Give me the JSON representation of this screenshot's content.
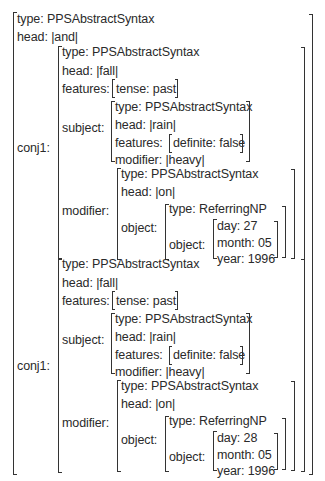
{
  "root": {
    "type_label": "type: PPSAbstractSyntax",
    "head_label": "head: |and|",
    "conj_label_1": "conj1:",
    "conj_label_2": "conj1:"
  },
  "conjuncts": [
    {
      "type_label": "type: PPSAbstractSyntax",
      "head_label": "head: |fall|",
      "features_key": "features:",
      "features_value": "tense: past",
      "subject_key": "subject:",
      "subject": {
        "type_label": "type: PPSAbstractSyntax",
        "head_label": "head: |rain|",
        "features_key": "features:",
        "features_value": "definite: false",
        "modifier_label": "modifier: |heavy|"
      },
      "modifier_key": "modifier:",
      "modifier": {
        "type_label": "type: PPSAbstractSyntax",
        "head_label": "head: |on|",
        "object_key": "object:",
        "object": {
          "type_label": "type: ReferringNP",
          "object_key": "object:",
          "day_label": "day: 27",
          "month_label": "month: 05",
          "year_label": "year: 1996"
        }
      }
    },
    {
      "type_label": "type: PPSAbstractSyntax",
      "head_label": "head: |fall|",
      "features_key": "features:",
      "features_value": "tense: past",
      "subject_key": "subject:",
      "subject": {
        "type_label": "type: PPSAbstractSyntax",
        "head_label": "head: |rain|",
        "features_key": "features:",
        "features_value": "definite: false",
        "modifier_label": "modifier: |heavy|"
      },
      "modifier_key": "modifier:",
      "modifier": {
        "type_label": "type: PPSAbstractSyntax",
        "head_label": "head: |on|",
        "object_key": "object:",
        "object": {
          "type_label": "type: ReferringNP",
          "object_key": "object:",
          "day_label": "day: 28",
          "month_label": "month: 05",
          "year_label": "year: 1996"
        }
      }
    }
  ]
}
